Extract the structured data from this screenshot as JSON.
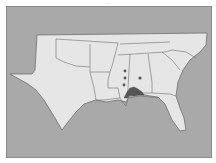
{
  "caption": "…",
  "map": {
    "title": "Southeastern United States range map",
    "background_color": "#a9a9a9",
    "land_color": "#e6e6e6",
    "border_color": "#6e6e6e",
    "highlight_color": "#555555",
    "states": [
      "Texas",
      "Oklahoma",
      "Arkansas",
      "Louisiana",
      "Mississippi",
      "Alabama",
      "Georgia",
      "Florida",
      "Tennessee",
      "South Carolina",
      "North Carolina"
    ],
    "occurrence_points": [
      {
        "label": "record-1",
        "x": 125,
        "y": 71
      },
      {
        "label": "record-2",
        "x": 125,
        "y": 78
      },
      {
        "label": "record-3",
        "x": 124,
        "y": 85
      },
      {
        "label": "record-4",
        "x": 140,
        "y": 78
      }
    ],
    "shaded_region": "Gulf coast Alabama / Florida panhandle"
  }
}
